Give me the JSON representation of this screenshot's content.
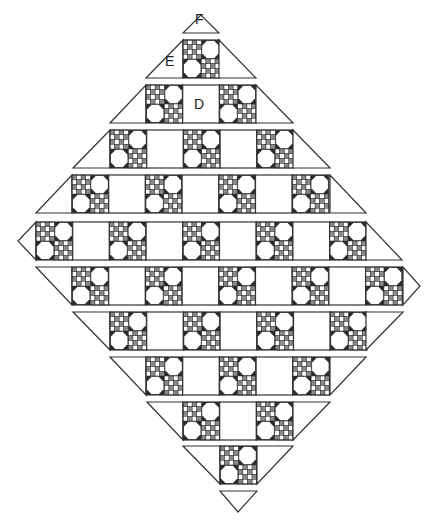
{
  "diagram": {
    "colors": {
      "line": "#333333",
      "gray": "#8a8a8a",
      "dark": "#2a2a2a",
      "fill": "#ffffff"
    },
    "block_size": 36.7,
    "row_height": 38,
    "labels": [
      {
        "text": "F",
        "x": 195,
        "y": 19,
        "refers_to": "corner triangle"
      },
      {
        "text": "E",
        "x": 165,
        "y": 61,
        "refers_to": "side setting triangle"
      },
      {
        "text": "D",
        "x": 194,
        "y": 97,
        "refers_to": "plain setting square"
      }
    ],
    "rows": [
      {
        "name": "row-E",
        "y": 40,
        "left": {
          "type": "tri-up",
          "outer": 146,
          "inner": 183
        },
        "cells": [
          "P"
        ],
        "start": 183,
        "right": {
          "type": "tri-up",
          "inner": 219,
          "outer": 256
        }
      },
      {
        "name": "row-D",
        "y": 85,
        "left": {
          "type": "tri-up",
          "outer": 110,
          "inner": 146
        },
        "cells": [
          "P",
          "D",
          "P"
        ],
        "start": 146,
        "right": {
          "type": "tri-up",
          "inner": 256,
          "outer": 293
        }
      },
      {
        "name": "row-4",
        "y": 130,
        "left": {
          "type": "tri-up",
          "outer": 73,
          "inner": 110
        },
        "cells": [
          "P",
          "S",
          "P",
          "S",
          "P"
        ],
        "start": 110,
        "right": {
          "type": "tri-up",
          "inner": 293,
          "outer": 330
        }
      },
      {
        "name": "row-5",
        "y": 175,
        "left": {
          "type": "tri-up",
          "outer": 36,
          "inner": 72
        },
        "cells": [
          "P",
          "S",
          "P",
          "S",
          "P",
          "S",
          "P"
        ],
        "start": 72,
        "right": {
          "type": "tri-up",
          "inner": 330,
          "outer": 366
        }
      },
      {
        "name": "row-6",
        "y": 222,
        "left": {
          "type": "point",
          "tip": 18,
          "inner": 36
        },
        "cells": [
          "P",
          "S",
          "P",
          "S",
          "P",
          "S",
          "P",
          "S",
          "P"
        ],
        "start": 36,
        "right": {
          "type": "tri-up",
          "inner": 366,
          "outer": 402
        }
      },
      {
        "name": "row-7",
        "y": 267,
        "left": {
          "type": "tri-down",
          "outer": 36,
          "inner": 72
        },
        "cells": [
          "P",
          "S",
          "P",
          "S",
          "P",
          "S",
          "P",
          "S",
          "P"
        ],
        "start": 72,
        "right": {
          "type": "point",
          "inner": 403,
          "tip": 420
        }
      },
      {
        "name": "row-8",
        "y": 312,
        "left": {
          "type": "tri-down",
          "outer": 73,
          "inner": 110
        },
        "cells": [
          "P",
          "S",
          "P",
          "S",
          "P",
          "S",
          "P"
        ],
        "start": 110,
        "right": {
          "type": "tri-down",
          "inner": 366,
          "outer": 403
        }
      },
      {
        "name": "row-9",
        "y": 357,
        "left": {
          "type": "tri-down",
          "outer": 110,
          "inner": 146
        },
        "cells": [
          "P",
          "S",
          "P",
          "S",
          "P"
        ],
        "start": 146,
        "right": {
          "type": "tri-down",
          "inner": 330,
          "outer": 366
        }
      },
      {
        "name": "row-10",
        "y": 402,
        "left": {
          "type": "tri-down",
          "outer": 147,
          "inner": 183
        },
        "cells": [
          "P",
          "S",
          "P"
        ],
        "start": 183,
        "right": {
          "type": "tri-down",
          "inner": 293,
          "outer": 330
        }
      },
      {
        "name": "row-11",
        "y": 446,
        "left": {
          "type": "tri-down",
          "outer": 183,
          "inner": 220
        },
        "cells": [
          "P"
        ],
        "start": 220,
        "right": {
          "type": "tri-down",
          "inner": 257,
          "outer": 293
        }
      }
    ],
    "corners": [
      {
        "name": "corner-F-top",
        "points": [
          [
            183,
            33
          ],
          [
            219,
            33
          ],
          [
            201,
            15
          ]
        ]
      },
      {
        "name": "corner-bottom",
        "points": [
          [
            220,
            491
          ],
          [
            257,
            491
          ],
          [
            238,
            512
          ]
        ]
      }
    ]
  }
}
